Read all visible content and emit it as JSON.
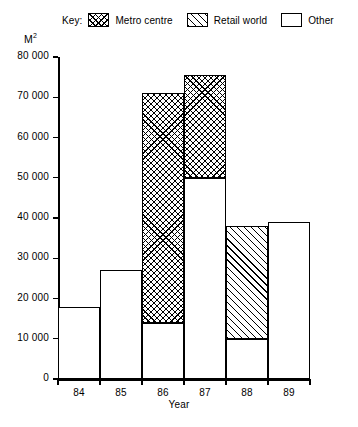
{
  "chart_data": {
    "type": "bar",
    "subtype": "stacked-column",
    "title": "",
    "xlabel": "Year",
    "ylabel": "M²",
    "categories": [
      "84",
      "85",
      "86",
      "87",
      "88",
      "89"
    ],
    "series": [
      {
        "name": "Metro centre",
        "pattern": "cross-hatch",
        "values": [
          0,
          0,
          57000,
          25500,
          0,
          0
        ]
      },
      {
        "name": "Retail world",
        "pattern": "diagonal-hatch",
        "values": [
          0,
          0,
          0,
          0,
          28000,
          0
        ]
      },
      {
        "name": "Other",
        "pattern": "plain",
        "values": [
          18000,
          27000,
          14000,
          50000,
          10000,
          39000
        ]
      }
    ],
    "stack_order": [
      "Other",
      "Retail world",
      "Metro centre"
    ],
    "totals": [
      18000,
      27000,
      71000,
      75500,
      38000,
      39000
    ],
    "ylim": [
      0,
      80000
    ],
    "ytick_values": [
      0,
      10000,
      20000,
      30000,
      40000,
      50000,
      60000,
      70000,
      80000
    ],
    "ytick_labels": [
      "0",
      "10 000",
      "20 000",
      "30 000",
      "40 000",
      "50 000",
      "60 000",
      "70 000",
      "80 000"
    ],
    "grid": false,
    "legend_position": "top"
  },
  "legend": {
    "key_label": "Key:",
    "entries": [
      {
        "label": "Metro centre",
        "pattern": "cross-hatch"
      },
      {
        "label": "Retail world",
        "pattern": "diagonal-hatch"
      },
      {
        "label": "Other",
        "pattern": "plain"
      }
    ]
  },
  "axes": {
    "y_title": "M",
    "y_title_exponent": "2",
    "x_title": "Year"
  }
}
